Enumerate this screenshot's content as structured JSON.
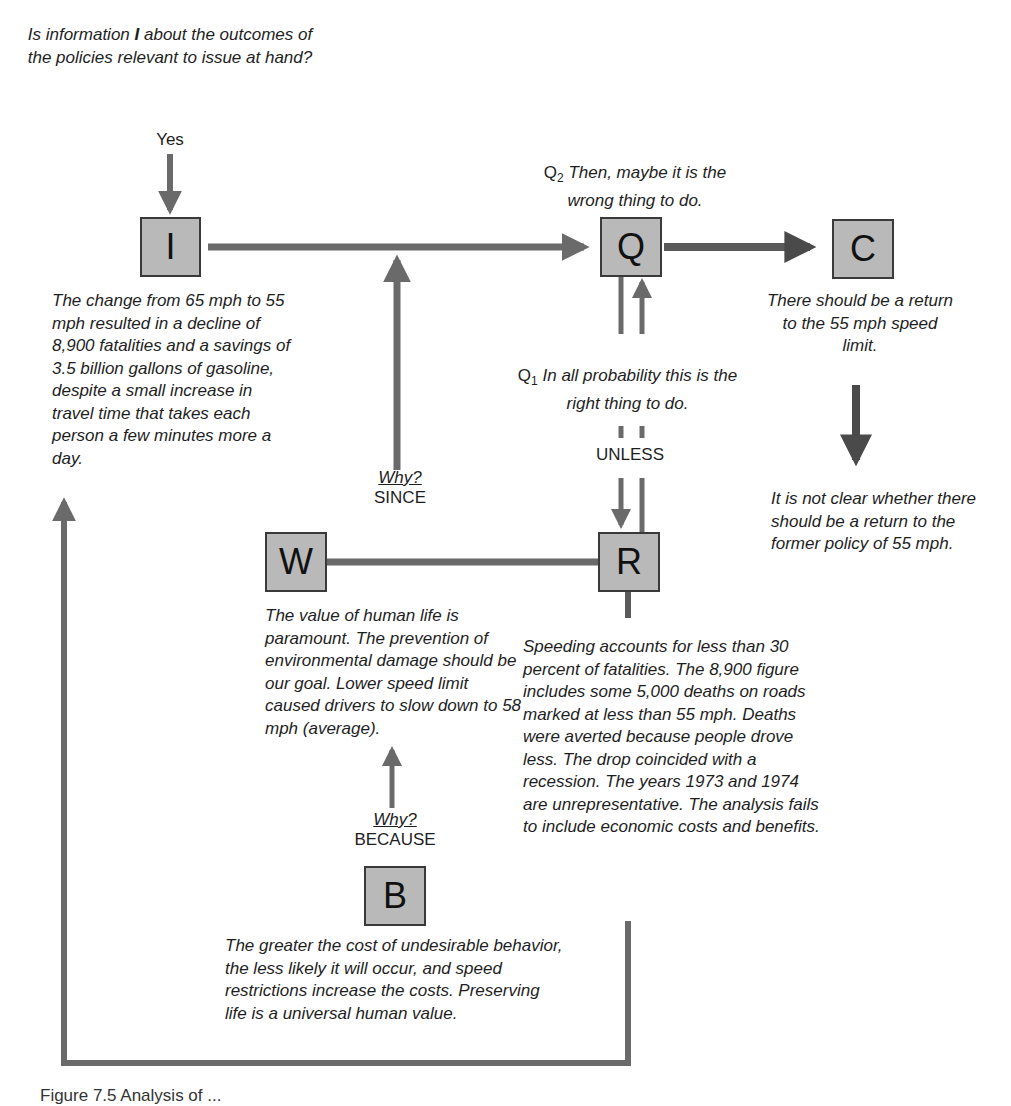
{
  "diagram": {
    "type": "argument-map",
    "nodes": {
      "I": {
        "label": "I",
        "text": "The change from 65 mph to 55 mph resulted in a decline of 8,900 fatalities and a savings of 3.5 billion gallons of gasoline, despite a small increase in travel time that takes each person a few minutes more a day."
      },
      "Q": {
        "label": "Q"
      },
      "C": {
        "label": "C",
        "text": "There should be a return to the 55 mph speed limit."
      },
      "W": {
        "label": "W",
        "text": "The value of human life is paramount. The prevention of environmental damage should be our goal. Lower speed limit caused drivers to slow down to 58 mph (average)."
      },
      "R": {
        "label": "R",
        "text": "Speeding accounts for less than 30 percent of fatalities. The 8,900 figure includes some 5,000 deaths on roads marked at less than 55 mph. Deaths were averted because people drove less. The drop coincided with a recession. The years 1973 and 1974 are unrepresentative. The analysis fails to include economic costs and benefits."
      },
      "B": {
        "label": "B",
        "text": "The greater the cost of undesirable behavior, the less likely it will occur, and speed restrictions increase the costs. Preserving life is a universal human value."
      }
    },
    "top_question": {
      "before": "Is information ",
      "bold": "I",
      "after": " about the outcomes of the policies relevant to issue at hand?"
    },
    "yes_label": "Yes",
    "q2": {
      "prefix": "Q",
      "sub": "2",
      "text": " Then, maybe it is the wrong thing to do."
    },
    "q1": {
      "prefix": "Q",
      "sub": "1",
      "text": " In all probability this is the right thing to do."
    },
    "unless_label": "UNLESS",
    "since": {
      "why": "Why?",
      "label": "SINCE"
    },
    "because": {
      "why": "Why?",
      "label": "BECAUSE"
    },
    "rebuttal_conclusion": "It is not clear whether there should be a return to the former policy of 55 mph.",
    "caption": "Figure 7.5  Analysis of ..."
  },
  "colors": {
    "arrow": "#6a6a6a",
    "node_fill": "#b9b9b9",
    "node_border": "#3a3a3a",
    "dark_arrow": "#4a4a4a"
  }
}
